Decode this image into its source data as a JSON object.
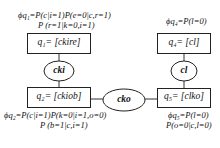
{
  "diagram": {
    "nodes": [
      {
        "id": "q1",
        "label": "q₁= [ckire]",
        "shape": "rect"
      },
      {
        "id": "q2",
        "label": "q₂= [ckiob]",
        "shape": "rect"
      },
      {
        "id": "q4",
        "label": "q₄= [cl]",
        "shape": "rect"
      },
      {
        "id": "q5",
        "label": "q₅= [clko]",
        "shape": "rect"
      }
    ],
    "separators": [
      {
        "id": "cki",
        "label": "cki",
        "shape": "ellipse",
        "connects": [
          "q1",
          "q2"
        ]
      },
      {
        "id": "cko",
        "label": "cko",
        "shape": "ellipse",
        "connects": [
          "q2",
          "q5"
        ]
      },
      {
        "id": "cl",
        "label": "cl",
        "shape": "ellipse",
        "connects": [
          "q4",
          "q5"
        ]
      }
    ],
    "potentials": {
      "q1": {
        "line1": "ϕq₁=P(c|i=1)P(e=0|c,r=1)",
        "line2": "P (r=1|k=0,i=1)"
      },
      "q2": {
        "line1": "ϕq₂=P(c|i=1)P(k=0|i=1,o=0)",
        "line2": "P (b=1|c,i=1)"
      },
      "q4": {
        "line1": "ϕq₄=P(l=0)"
      },
      "q5": {
        "line1": "ϕq₅=P(l=0)",
        "line2": "P(o=0|c,l=0)"
      }
    }
  }
}
